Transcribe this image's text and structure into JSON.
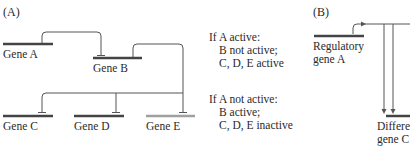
{
  "panel_a": {
    "label": "(A)",
    "genes": [
      {
        "name": "Gene A",
        "color": "#444444"
      },
      {
        "name": "Gene B",
        "color": "#444444"
      },
      {
        "name": "Gene C",
        "color": "#444444"
      },
      {
        "name": "Gene D",
        "color": "#444444"
      },
      {
        "name": "Gene E",
        "color": "#a0a0a0"
      }
    ],
    "conditions": [
      {
        "header": "If A active:",
        "lines": [
          "B not active;",
          "C, D, E active"
        ]
      },
      {
        "header": "If A not active:",
        "lines": [
          "B active;",
          "C, D, E inactive"
        ]
      }
    ]
  },
  "panel_b": {
    "label": "(B)",
    "regulatory_gene": [
      "Regulatory",
      "gene A"
    ],
    "target_gene": [
      "Differe",
      "gene C"
    ]
  },
  "colors": {
    "line": "#555555",
    "gene_bar": "#444444",
    "gene_bar_inactive": "#a0a0a0"
  }
}
